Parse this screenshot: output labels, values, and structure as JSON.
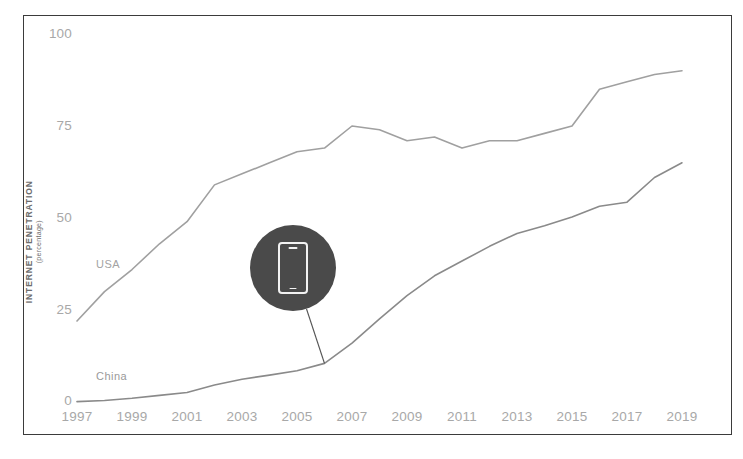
{
  "chart_data": {
    "type": "line",
    "title": "",
    "subtitle": "",
    "xlabel": "",
    "ylabel": "INTERNET PENETRATION",
    "ylabel_unit": "(percentage)",
    "xlim": [
      1997,
      2019
    ],
    "ylim": [
      0,
      100
    ],
    "yticks": [
      0,
      25,
      50,
      75,
      100
    ],
    "ytick_labels": [
      "0",
      "25",
      "50",
      "75",
      "100"
    ],
    "xticks": [
      1997,
      1999,
      2001,
      2003,
      2005,
      2007,
      2009,
      2011,
      2013,
      2015,
      2017,
      2019
    ],
    "xtick_labels": [
      "1997",
      "1999",
      "2001",
      "2003",
      "2005",
      "2007",
      "2009",
      "2011",
      "2013",
      "2015",
      "2017",
      "2019"
    ],
    "grid": false,
    "legend_position": "inline-labels",
    "x": [
      1997,
      1998,
      1999,
      2000,
      2001,
      2002,
      2003,
      2004,
      2005,
      2006,
      2007,
      2008,
      2009,
      2010,
      2011,
      2012,
      2013,
      2014,
      2015,
      2016,
      2017,
      2018,
      2019
    ],
    "series": [
      {
        "name": "USA",
        "color": "#a0a0a0",
        "values": [
          22,
          30,
          36,
          43,
          49,
          59,
          62,
          65,
          68,
          69,
          75,
          74,
          71,
          72,
          69,
          71,
          71,
          73,
          75,
          85,
          87,
          89,
          90
        ]
      },
      {
        "name": "China",
        "color": "#8a8a8a",
        "values": [
          0.1,
          0.4,
          1.0,
          1.8,
          2.6,
          4.6,
          6.2,
          7.3,
          8.5,
          10.5,
          16,
          22.6,
          28.9,
          34.3,
          38.3,
          42.3,
          45.8,
          47.9,
          50.3,
          53.2,
          54.3,
          61,
          65
        ]
      }
    ],
    "annotations": [
      {
        "name": "mobile-callout",
        "icon": "smartphone-icon",
        "badge_color": "#4a4a4a",
        "anchor_year": 2006,
        "anchor_value": 10.5
      }
    ]
  },
  "axes": {
    "y_title": "INTERNET PENETRATION",
    "y_unit": "(percentage)"
  },
  "labels": {
    "usa": "USA",
    "china": "China"
  }
}
